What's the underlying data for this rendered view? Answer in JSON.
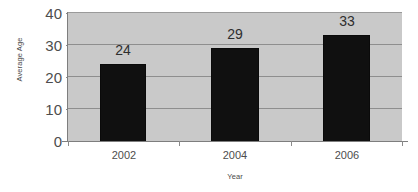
{
  "chart_data": {
    "type": "bar",
    "title": "",
    "subtitle": "",
    "categories": [
      "2002",
      "2004",
      "2006"
    ],
    "values": [
      24,
      29,
      33
    ],
    "series": [
      {
        "name": "Average Age",
        "values": [
          24,
          29,
          33
        ]
      }
    ],
    "data_labels": [
      "24",
      "29",
      "33"
    ],
    "xlabel": "Year",
    "ylabel": "Average Age",
    "ylim": [
      0,
      40
    ],
    "yticks": [
      0,
      10,
      20,
      30,
      40
    ],
    "ytick_labels": [
      "0",
      "10",
      "20",
      "30",
      "40"
    ],
    "grid": true,
    "grid_axis": "y",
    "legend": false,
    "legend_position": "none",
    "colors": {
      "bar": "#101010",
      "plot_background": "#c9c9c9",
      "figure_background": "#ffffff",
      "gridline": "#8e8e8e",
      "axis": "#7e7e7e",
      "text": "#4d4d4d"
    }
  },
  "axes": {
    "y_title": "Average Age",
    "x_title": "Year"
  },
  "y_ticks": [
    {
      "label": "40",
      "value": 40
    },
    {
      "label": "30",
      "value": 30
    },
    {
      "label": "20",
      "value": 20
    },
    {
      "label": "10",
      "value": 10
    },
    {
      "label": "0",
      "value": 0
    }
  ],
  "bars": [
    {
      "category": "2002",
      "value": 24,
      "label": "24"
    },
    {
      "category": "2004",
      "value": 29,
      "label": "29"
    },
    {
      "category": "2006",
      "value": 33,
      "label": "33"
    }
  ]
}
